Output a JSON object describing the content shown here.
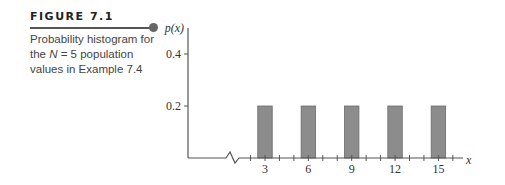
{
  "figure": {
    "label": "FIGURE 7.1",
    "caption_line1": "Probability histogram for",
    "caption_line2_prefix": "the ",
    "caption_line2_var": "N",
    "caption_line2_suffix": " = 5 population",
    "caption_line3": "values in Example 7.4"
  },
  "colors": {
    "bar_fill": "#8c8c8c",
    "bar_stroke": "#6a6a6a",
    "axis": "#555555"
  },
  "chart_data": {
    "type": "bar",
    "title": "Probability histogram for the N = 5 population values in Example 7.4",
    "xlabel": "x",
    "ylabel": "p(x)",
    "categories": [
      3,
      6,
      9,
      12,
      15
    ],
    "values": [
      0.2,
      0.2,
      0.2,
      0.2,
      0.2
    ],
    "x_tick_labels": [
      "3",
      "6",
      "9",
      "12",
      "15"
    ],
    "y_tick_labels": [
      "0.2",
      "0.4"
    ],
    "y_ticks": [
      0.2,
      0.4
    ],
    "x_minor_ticks": [
      2,
      3,
      4,
      5,
      6,
      7,
      8,
      9,
      10,
      11,
      12,
      13,
      14,
      15,
      16
    ],
    "ylim": [
      0,
      0.5
    ],
    "xlim": [
      2,
      16
    ],
    "axis_break": true,
    "grid": false,
    "bar_width": 1
  }
}
